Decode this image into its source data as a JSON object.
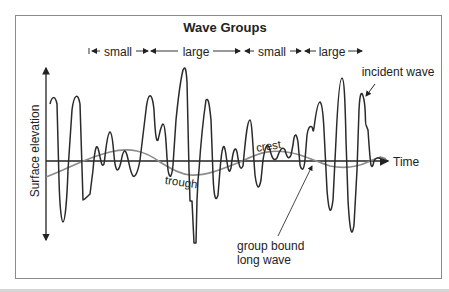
{
  "diagram": {
    "title": "Wave Groups",
    "groups": [
      {
        "label": "small"
      },
      {
        "label": "large"
      },
      {
        "label": "small"
      },
      {
        "label": "large"
      }
    ],
    "y_axis_label": "Surface elevation",
    "x_axis_label": "Time",
    "annotations": {
      "incident_wave": "incident wave",
      "crest": "crest",
      "trough": "trough",
      "long_wave_line1": "group bound",
      "long_wave_line2": "long wave"
    },
    "colors": {
      "incident_wave": "#2a2a2a",
      "long_wave": "#8c8c8c",
      "axis": "#222222",
      "frame": "#8a8a8a"
    }
  }
}
